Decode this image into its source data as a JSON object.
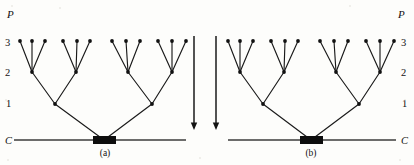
{
  "figure": {
    "width": 414,
    "height": 165,
    "background": "#fdfdfb",
    "ink_color": "#131313"
  },
  "panels": [
    {
      "id": "a",
      "caption": "(a)",
      "caption_x": 105,
      "caption_y": 156,
      "direction": "upward-branching",
      "axis_label": "P",
      "axis_label_x": 7,
      "axis_label_y": 18,
      "labels_side": "left",
      "level_labels": [
        {
          "text": "3",
          "x": 5,
          "y": 46,
          "level_y": 41
        },
        {
          "text": "2",
          "x": 5,
          "y": 76,
          "level_y": 72
        },
        {
          "text": "1",
          "x": 6,
          "y": 107,
          "level_y": 104
        },
        {
          "text": "C",
          "x": 5,
          "y": 144,
          "level_y": 140
        }
      ],
      "baseline": {
        "x1": 14,
        "x2": 186,
        "y": 140
      },
      "base_block": {
        "x": 93,
        "y": 136,
        "width": 23,
        "height": 8
      },
      "root": {
        "x": 104,
        "y": 140
      },
      "level1_nodes": [
        {
          "x": 55,
          "y": 104
        },
        {
          "x": 152,
          "y": 104
        }
      ],
      "level2_nodes": [
        {
          "x": 32,
          "y": 72
        },
        {
          "x": 76,
          "y": 72
        },
        {
          "x": 128,
          "y": 72
        },
        {
          "x": 172,
          "y": 72
        }
      ],
      "level3_leaves": [
        {
          "x": 20,
          "y": 41
        },
        {
          "x": 32,
          "y": 41
        },
        {
          "x": 45,
          "y": 41
        },
        {
          "x": 63,
          "y": 41
        },
        {
          "x": 77,
          "y": 41
        },
        {
          "x": 90,
          "y": 41
        },
        {
          "x": 112,
          "y": 41
        },
        {
          "x": 126,
          "y": 41
        },
        {
          "x": 140,
          "y": 41
        },
        {
          "x": 158,
          "y": 41
        },
        {
          "x": 172,
          "y": 41
        },
        {
          "x": 186,
          "y": 41
        }
      ]
    },
    {
      "id": "b",
      "caption": "(b)",
      "caption_x": 311,
      "caption_y": 156,
      "direction": "upward-branching",
      "axis_label": "P",
      "axis_label_x": 398,
      "axis_label_y": 18,
      "labels_side": "right",
      "level_labels": [
        {
          "text": "3",
          "x": 401,
          "y": 46,
          "level_y": 41
        },
        {
          "text": "2",
          "x": 401,
          "y": 76,
          "level_y": 72
        },
        {
          "text": "1",
          "x": 402,
          "y": 107,
          "level_y": 104
        },
        {
          "text": "C",
          "x": 401,
          "y": 144,
          "level_y": 140
        }
      ],
      "baseline": {
        "x1": 228,
        "x2": 396,
        "y": 140
      },
      "base_block": {
        "x": 300,
        "y": 136,
        "width": 23,
        "height": 8
      },
      "root": {
        "x": 311,
        "y": 140
      },
      "level1_nodes": [
        {
          "x": 263,
          "y": 104
        },
        {
          "x": 359,
          "y": 104
        }
      ],
      "level2_nodes": [
        {
          "x": 240,
          "y": 72
        },
        {
          "x": 284,
          "y": 72
        },
        {
          "x": 336,
          "y": 72
        },
        {
          "x": 380,
          "y": 72
        }
      ],
      "level3_leaves": [
        {
          "x": 228,
          "y": 41
        },
        {
          "x": 240,
          "y": 41
        },
        {
          "x": 253,
          "y": 41
        },
        {
          "x": 271,
          "y": 41
        },
        {
          "x": 285,
          "y": 41
        },
        {
          "x": 298,
          "y": 41
        },
        {
          "x": 320,
          "y": 41
        },
        {
          "x": 334,
          "y": 41
        },
        {
          "x": 348,
          "y": 41
        },
        {
          "x": 366,
          "y": 41
        },
        {
          "x": 380,
          "y": 41
        },
        {
          "x": 394,
          "y": 41
        }
      ]
    }
  ],
  "arrows": [
    {
      "name": "arrow-left",
      "x": 194,
      "y_start": 36,
      "y_end": 130,
      "direction": "down"
    },
    {
      "name": "arrow-right",
      "x": 216,
      "y_start": 36,
      "y_end": 130,
      "direction": "down"
    }
  ],
  "legend_text": {
    "axis_symbol": "P",
    "base_symbol": "C",
    "levels": [
      "3",
      "2",
      "1"
    ]
  }
}
